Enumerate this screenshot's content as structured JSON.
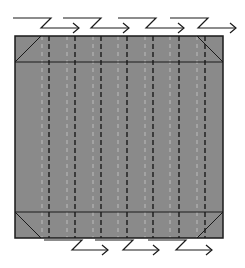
{
  "diagram": {
    "colors": {
      "background": "#ffffff",
      "paper_fill": "#8a8a8a",
      "outline": "#1a1a1a",
      "mountain_fold": "#1a1a1a",
      "valley_fold": "#b5b5b5",
      "arrow": "#1a1a1a"
    },
    "square": {
      "x": 15,
      "y": 36,
      "width": 208,
      "height": 202
    },
    "horizontal_creases": [
      62,
      212
    ],
    "corner_diagonals": [
      {
        "name": "top-left",
        "x1": 15,
        "y1": 62,
        "x2": 41,
        "y2": 36
      },
      {
        "name": "top-right",
        "x1": 197,
        "y1": 36,
        "x2": 223,
        "y2": 62
      },
      {
        "name": "bottom-left",
        "x1": 15,
        "y1": 212,
        "x2": 41,
        "y2": 238
      },
      {
        "name": "bottom-right",
        "x1": 197,
        "y1": 238,
        "x2": 223,
        "y2": 212
      }
    ],
    "vertical_creases": [
      {
        "x": 42,
        "type": "valley"
      },
      {
        "x": 49,
        "type": "mountain"
      },
      {
        "x": 67,
        "type": "valley"
      },
      {
        "x": 75,
        "type": "mountain"
      },
      {
        "x": 93,
        "type": "valley"
      },
      {
        "x": 101,
        "type": "mountain"
      },
      {
        "x": 118,
        "type": "valley"
      },
      {
        "x": 127,
        "type": "mountain"
      },
      {
        "x": 145,
        "type": "valley"
      },
      {
        "x": 153,
        "type": "mountain"
      },
      {
        "x": 170,
        "type": "valley"
      },
      {
        "x": 179,
        "type": "mountain"
      },
      {
        "x": 197,
        "type": "valley"
      },
      {
        "x": 205,
        "type": "mountain"
      }
    ],
    "top_pleat_arrows": [
      {
        "start": 13,
        "top_y": 18,
        "bottom_y": 28
      },
      {
        "start": 63,
        "top_y": 18,
        "bottom_y": 28
      },
      {
        "start": 118,
        "top_y": 18,
        "bottom_y": 28
      },
      {
        "start": 170,
        "top_y": 18,
        "bottom_y": 28
      }
    ],
    "bottom_pleat_arrows": [
      {
        "start": 44,
        "top_y": 240,
        "bottom_y": 250
      },
      {
        "start": 95,
        "top_y": 240,
        "bottom_y": 250
      },
      {
        "start": 148,
        "top_y": 240,
        "bottom_y": 250
      }
    ]
  }
}
